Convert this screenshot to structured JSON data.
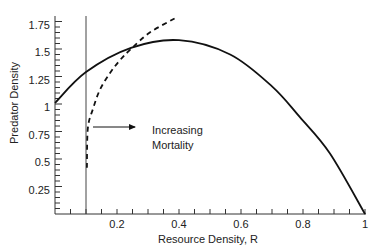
{
  "chart_data": {
    "type": "line",
    "title": "",
    "xlabel": "Resource Density, R",
    "ylabel": "Predator Density",
    "xlim": [
      0,
      1
    ],
    "ylim": [
      0,
      1.75
    ],
    "xticks": [
      0.2,
      0.4,
      0.6,
      0.8,
      1
    ],
    "xtick_labels": [
      "0.2",
      "0.4",
      "0.6",
      "0.8",
      "1"
    ],
    "yticks": [
      0.25,
      0.5,
      0.75,
      1,
      1.25,
      1.5,
      1.75
    ],
    "ytick_labels": [
      "0.25",
      "0.5",
      "0.75",
      "1",
      "1.25",
      "1.5",
      "1.75"
    ],
    "grid": false,
    "series": [
      {
        "name": "Prey isocline",
        "style": "solid",
        "x": [
          0,
          0.1,
          0.245,
          0.4,
          0.565,
          0.7,
          0.79,
          0.887,
          1.0
        ],
        "y": [
          1.01,
          1.29,
          1.51,
          1.58,
          1.45,
          1.16,
          0.88,
          0.55,
          0
        ]
      },
      {
        "name": "Predator isocline",
        "style": "dashed",
        "x": [
          0.103,
          0.106,
          0.123,
          0.145,
          0.177,
          0.21,
          0.245,
          0.306,
          0.394
        ],
        "y": [
          0.42,
          0.78,
          0.96,
          1.13,
          1.28,
          1.4,
          1.5,
          1.65,
          1.79
        ]
      },
      {
        "name": "Vertical reference line",
        "style": "thin-solid",
        "x": [
          0.1,
          0.1
        ],
        "y": [
          0,
          1.75
        ]
      }
    ],
    "annotations": [
      {
        "text": "Increasing",
        "line": 1
      },
      {
        "text": "Mortality",
        "line": 2
      },
      {
        "type": "arrow",
        "direction": "right",
        "from_x": 0.122,
        "to_x": 0.258,
        "y": 0.79
      }
    ]
  },
  "labels": {
    "xlabel": "Resource Density, R",
    "ylabel": "Predator Density",
    "annotation_line1": "Increasing",
    "annotation_line2": "Mortality"
  },
  "ticks": {
    "x": [
      "0.2",
      "0.4",
      "0.6",
      "0.8",
      "1"
    ],
    "y": [
      "0.25",
      "0.5",
      "0.75",
      "1",
      "1.25",
      "1.5",
      "1.75"
    ]
  }
}
